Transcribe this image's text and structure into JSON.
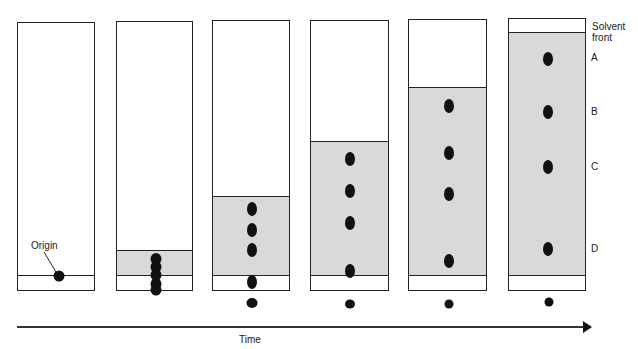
{
  "diagram": {
    "type": "paper chromatography time sequence",
    "colors": {
      "solvent_fill": "#d9d9d9",
      "outline": "#222222",
      "spot": "#111111",
      "paper": "#ffffff"
    },
    "labels": {
      "origin": "Origin",
      "solvent_front": "Solvent front",
      "solvent_front_line1": "Solvent",
      "solvent_front_line2": "front",
      "time_axis": "Time",
      "spot_labels": [
        "A",
        "B",
        "C",
        "D"
      ]
    },
    "strips": [
      {
        "index": 1,
        "x": 17,
        "top": 22,
        "width": 78,
        "bottom": 290,
        "solvent_front_y": null,
        "spots_y": [
          275
        ],
        "note": "start, sample at origin"
      },
      {
        "index": 2,
        "x": 116,
        "top": 21,
        "width": 77,
        "bottom": 290,
        "solvent_front_y": 250,
        "spots_y": [
          256,
          264,
          272,
          281,
          290
        ],
        "note": "spots merged"
      },
      {
        "index": 3,
        "x": 212,
        "top": 20,
        "width": 78,
        "bottom": 290,
        "solvent_front_y": 196,
        "spots_y": [
          207,
          228,
          249,
          281,
          302
        ]
      },
      {
        "index": 4,
        "x": 310,
        "top": 20,
        "width": 79,
        "bottom": 290,
        "solvent_front_y": 141,
        "spots_y": [
          158,
          190,
          222,
          270,
          303
        ]
      },
      {
        "index": 5,
        "x": 408,
        "top": 19,
        "width": 79,
        "bottom": 290,
        "solvent_front_y": 87,
        "spots_y": [
          105,
          152,
          193,
          260,
          303
        ]
      },
      {
        "index": 6,
        "x": 508,
        "top": 18,
        "width": 78,
        "bottom": 290,
        "solvent_front_y": 32,
        "spots_y": [
          58,
          111,
          166,
          248,
          301
        ],
        "note": "final chromatogram with labels A-D"
      }
    ]
  }
}
